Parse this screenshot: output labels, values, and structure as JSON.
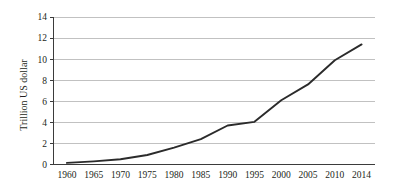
{
  "chart_data": {
    "type": "line",
    "title": "",
    "subtitle": "",
    "xlabel": "",
    "ylabel": "Trillion US dollar",
    "x": [
      1960,
      1965,
      1970,
      1975,
      1980,
      1985,
      1990,
      1995,
      2000,
      2005,
      2010,
      2014
    ],
    "x_tick_labels": [
      "1960",
      "1965",
      "1970",
      "1975",
      "1980",
      "1985",
      "1990",
      "1995",
      "2000",
      "2005",
      "2010",
      "2014"
    ],
    "y_tick_labels": [
      "0",
      "2",
      "4",
      "6",
      "8",
      "10",
      "12",
      "14"
    ],
    "y_ticks": [
      0,
      2,
      4,
      6,
      8,
      10,
      12,
      14
    ],
    "values": [
      0.15,
      0.3,
      0.5,
      0.9,
      1.6,
      2.4,
      3.7,
      4.05,
      6.1,
      7.6,
      9.9,
      11.4
    ],
    "series": [
      {
        "name": "Trillion US dollar",
        "values": [
          0.15,
          0.3,
          0.5,
          0.9,
          1.6,
          2.4,
          3.7,
          4.05,
          6.1,
          7.6,
          9.9,
          11.4
        ]
      }
    ],
    "ylim": [
      0,
      14
    ],
    "grid": "horizontal",
    "legend": "none",
    "line_color": "#2b2b2b",
    "gridline_color": "#a6a6a6",
    "axis_color": "#3b3b3b",
    "background_color": "#ffffff"
  }
}
